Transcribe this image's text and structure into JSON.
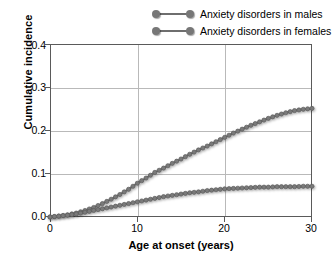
{
  "chart_data": {
    "type": "line",
    "title": "",
    "xlabel": "Age at onset (years)",
    "ylabel": "Cumulative incidence",
    "xlim": [
      0,
      30
    ],
    "ylim": [
      0.0,
      0.4
    ],
    "xticks": [
      "0",
      "10",
      "20",
      "30"
    ],
    "xtick_values": [
      0,
      10,
      20,
      30
    ],
    "yticks": [
      "0.0",
      "0.1",
      "0.2",
      "0.3",
      "0.4"
    ],
    "ytick_values": [
      0.0,
      0.1,
      0.2,
      0.3,
      0.4
    ],
    "grid": "both",
    "legend_position": "top-right",
    "marker": "circle",
    "series": [
      {
        "name": "Anxiety disorders in males",
        "color": "#6e6e6e",
        "x": [
          0,
          1,
          2,
          3,
          4,
          5,
          6,
          7,
          8,
          9,
          10,
          11,
          12,
          13,
          14,
          15,
          16,
          17,
          18,
          19,
          20,
          21,
          22,
          23,
          24,
          25,
          26,
          27,
          28,
          29,
          30
        ],
        "values": [
          0.0,
          0.002,
          0.005,
          0.009,
          0.015,
          0.022,
          0.031,
          0.041,
          0.052,
          0.064,
          0.078,
          0.09,
          0.103,
          0.113,
          0.124,
          0.134,
          0.145,
          0.155,
          0.164,
          0.174,
          0.184,
          0.194,
          0.203,
          0.212,
          0.22,
          0.228,
          0.235,
          0.241,
          0.246,
          0.249,
          0.251
        ]
      },
      {
        "name": "Anxiety disorders in females",
        "color": "#6e6e6e",
        "x": [
          0,
          1,
          2,
          3,
          4,
          5,
          6,
          7,
          8,
          9,
          10,
          11,
          12,
          13,
          14,
          15,
          16,
          17,
          18,
          19,
          20,
          21,
          22,
          23,
          24,
          25,
          26,
          27,
          28,
          29,
          30
        ],
        "values": [
          0.0,
          0.002,
          0.004,
          0.007,
          0.011,
          0.015,
          0.019,
          0.023,
          0.027,
          0.031,
          0.035,
          0.039,
          0.043,
          0.047,
          0.05,
          0.053,
          0.056,
          0.058,
          0.061,
          0.063,
          0.065,
          0.066,
          0.067,
          0.068,
          0.069,
          0.069,
          0.07,
          0.07,
          0.07,
          0.071,
          0.071
        ]
      }
    ]
  },
  "legend": {
    "items": [
      {
        "label": "Anxiety disorders in males"
      },
      {
        "label": "Anxiety disorders in females"
      }
    ]
  },
  "axes": {
    "x_title": "Age at onset (years)",
    "y_title": "Cumulative incidence",
    "x_labels": [
      "0",
      "10",
      "20",
      "30"
    ],
    "y_labels": [
      "0.0",
      "0.1",
      "0.2",
      "0.3",
      "0.4"
    ]
  }
}
